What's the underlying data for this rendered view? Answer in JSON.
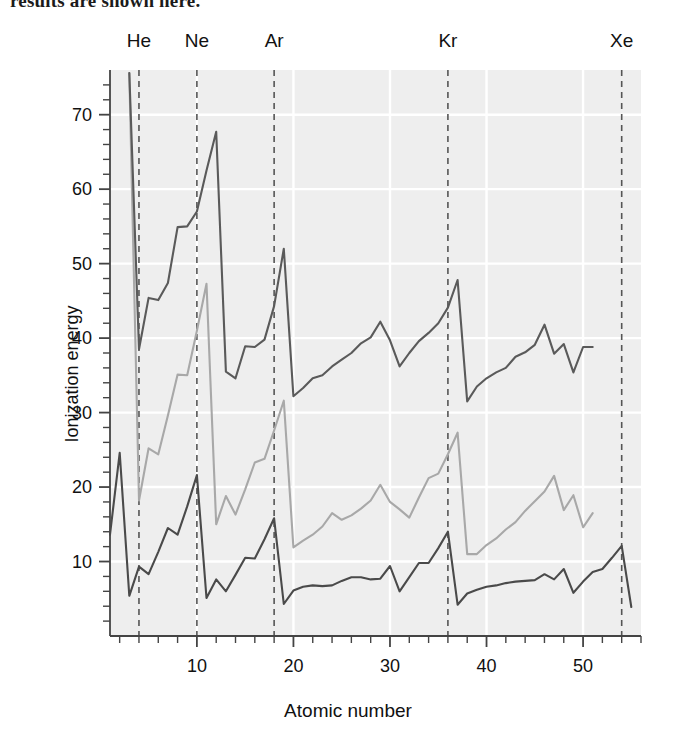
{
  "page": {
    "cut_off_caption": "results are shown here."
  },
  "chart_data": {
    "type": "line",
    "title": "",
    "xlabel": "Atomic number",
    "ylabel": "Ionization energy",
    "xlim": [
      1,
      56
    ],
    "ylim": [
      0,
      76
    ],
    "xticks": [
      10,
      20,
      30,
      40,
      50
    ],
    "yticks": [
      10,
      20,
      30,
      40,
      50,
      60,
      70
    ],
    "x_minor_step": 2,
    "y_minor_step": 2,
    "grid": "white gridlines on light-gray panel, major only",
    "legend": "none",
    "annotations": [
      {
        "label": "He",
        "x": 4,
        "style": "dashed-vline"
      },
      {
        "label": "Ne",
        "x": 10,
        "style": "dashed-vline"
      },
      {
        "label": "Ar",
        "x": 18,
        "style": "dashed-vline"
      },
      {
        "label": "Kr",
        "x": 36,
        "style": "dashed-vline"
      },
      {
        "label": "Xe",
        "x": 54,
        "style": "dashed-vline"
      }
    ],
    "colors": {
      "first_ionization": "#4a4a4a",
      "second_ionization": "#a8a8a8",
      "third_ionization": "#5a5a5a",
      "panel": "#eeeeee",
      "grid": "#ffffff",
      "axis": "#444444"
    },
    "series": [
      {
        "name": "first",
        "color": "#4a4a4a",
        "x": [
          1,
          2,
          3,
          4,
          5,
          6,
          7,
          8,
          9,
          10,
          11,
          12,
          13,
          14,
          15,
          16,
          17,
          18,
          19,
          20,
          21,
          22,
          23,
          24,
          25,
          26,
          27,
          28,
          29,
          30,
          31,
          32,
          33,
          34,
          35,
          36,
          37,
          38,
          39,
          40,
          41,
          42,
          43,
          44,
          45,
          46,
          47,
          48,
          49,
          50,
          51,
          52,
          53,
          54,
          55
        ],
        "values": [
          13.6,
          24.6,
          5.4,
          9.3,
          8.3,
          11.3,
          14.5,
          13.6,
          17.4,
          21.6,
          5.1,
          7.6,
          6.0,
          8.2,
          10.5,
          10.4,
          13.0,
          15.8,
          4.3,
          6.1,
          6.6,
          6.8,
          6.7,
          6.8,
          7.4,
          7.9,
          7.9,
          7.6,
          7.7,
          9.4,
          6.0,
          7.9,
          9.8,
          9.8,
          11.8,
          14.0,
          4.2,
          5.7,
          6.2,
          6.6,
          6.8,
          7.1,
          7.3,
          7.4,
          7.5,
          8.3,
          7.6,
          9.0,
          5.8,
          7.3,
          8.6,
          9.0,
          10.5,
          12.1,
          3.9
        ]
      },
      {
        "name": "second",
        "color": "#a8a8a8",
        "x": [
          3,
          4,
          5,
          6,
          7,
          8,
          9,
          10,
          11,
          12,
          13,
          14,
          15,
          16,
          17,
          18,
          19,
          20,
          21,
          22,
          23,
          24,
          25,
          26,
          27,
          28,
          29,
          30,
          31,
          32,
          33,
          34,
          35,
          36,
          37,
          38,
          39,
          40,
          41,
          42,
          43,
          44,
          45,
          46,
          47,
          48,
          49,
          50,
          51
        ],
        "values": [
          75.6,
          18.2,
          25.2,
          24.4,
          29.6,
          35.1,
          35.0,
          41.0,
          47.3,
          15.0,
          18.8,
          16.3,
          19.7,
          23.3,
          23.8,
          27.6,
          31.6,
          11.9,
          12.8,
          13.6,
          14.7,
          16.5,
          15.6,
          16.2,
          17.1,
          18.2,
          20.3,
          18.0,
          17.0,
          15.9,
          18.6,
          21.2,
          21.8,
          24.4,
          27.3,
          11.0,
          11.0,
          12.2,
          13.1,
          14.3,
          15.3,
          16.8,
          18.1,
          19.4,
          21.5,
          16.9,
          18.9,
          14.6,
          16.5
        ]
      },
      {
        "name": "third",
        "color": "#5a5a5a",
        "x": [
          3,
          4,
          5,
          6,
          7,
          8,
          9,
          10,
          11,
          12,
          13,
          14,
          15,
          16,
          17,
          18,
          19,
          20,
          21,
          22,
          23,
          24,
          25,
          26,
          27,
          28,
          29,
          30,
          31,
          32,
          33,
          34,
          35,
          36,
          37,
          38,
          39,
          40,
          41,
          42,
          43,
          44,
          45,
          46,
          47,
          48,
          49,
          50,
          51
        ],
        "values": [
          75.6,
          38.5,
          45.4,
          45.1,
          47.4,
          54.9,
          55.0,
          57.0,
          62.5,
          67.7,
          35.5,
          34.6,
          38.9,
          38.8,
          39.8,
          44.3,
          52.0,
          32.2,
          33.3,
          34.6,
          35.0,
          36.2,
          37.1,
          38.0,
          39.3,
          40.1,
          42.2,
          39.7,
          36.2,
          38.0,
          39.6,
          40.7,
          42.0,
          44.1,
          47.8,
          31.5,
          33.5,
          34.6,
          35.4,
          36.0,
          37.5,
          38.1,
          39.1,
          41.8,
          37.9,
          39.2,
          35.4,
          38.8,
          38.8
        ]
      }
    ]
  }
}
